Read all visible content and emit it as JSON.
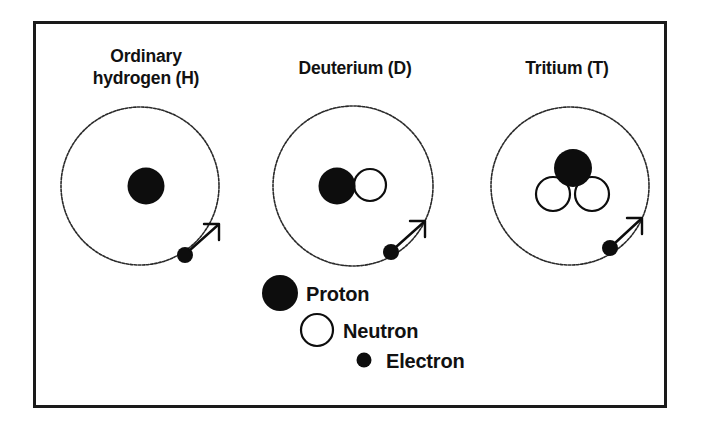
{
  "figure": {
    "frame": {
      "x": 33,
      "y": 21,
      "width": 634,
      "height": 387,
      "border_color": "#1a1a1a"
    }
  },
  "colors": {
    "proton_fill": "#0d0d0d",
    "neutron_fill": "#ffffff",
    "neutron_stroke": "#0d0d0d",
    "electron_fill": "#0d0d0d",
    "orbit_stroke": "#2b2b2b",
    "background": "#ffffff",
    "text": "#111111"
  },
  "atoms": [
    {
      "id": "hydrogen",
      "label_lines": [
        "Ordinary",
        "hydrogen (H)"
      ],
      "label_x": 146,
      "label_y_first": 62,
      "label_line_height": 22,
      "orbit": {
        "cx": 140,
        "cy": 186,
        "r": 79
      },
      "protons": [
        {
          "cx": 146,
          "cy": 186,
          "r": 18.5
        }
      ],
      "neutrons": [],
      "electron": {
        "cx": 185,
        "cy": 255,
        "r": 8
      },
      "arrow": {
        "x1": 190,
        "y1": 250,
        "x2": 218,
        "y2": 225
      }
    },
    {
      "id": "deuterium",
      "label_lines": [
        "Deuterium (D)"
      ],
      "label_x": 355,
      "label_y_first": 74,
      "label_line_height": 22,
      "orbit": {
        "cx": 353,
        "cy": 186,
        "r": 80
      },
      "protons": [
        {
          "cx": 337,
          "cy": 186,
          "r": 18.5
        }
      ],
      "neutrons": [
        {
          "cx": 370,
          "cy": 185,
          "r": 16
        }
      ],
      "electron": {
        "cx": 391,
        "cy": 252,
        "r": 8
      },
      "arrow": {
        "x1": 396,
        "y1": 247,
        "x2": 424,
        "y2": 222
      }
    },
    {
      "id": "tritium",
      "label_lines": [
        "Tritium (T)"
      ],
      "label_x": 567,
      "label_y_first": 74,
      "label_line_height": 22,
      "orbit": {
        "cx": 570,
        "cy": 186,
        "r": 79
      },
      "protons": [
        {
          "cx": 573,
          "cy": 168,
          "r": 19
        }
      ],
      "neutrons": [
        {
          "cx": 553,
          "cy": 194,
          "r": 17
        },
        {
          "cx": 592,
          "cy": 194,
          "r": 17
        }
      ],
      "electron": {
        "cx": 610,
        "cy": 248,
        "r": 8
      },
      "arrow": {
        "x1": 615,
        "y1": 243,
        "x2": 641,
        "y2": 219
      }
    }
  ],
  "legend": {
    "items": [
      {
        "id": "proton",
        "label": "Proton",
        "marker": "filled-circle",
        "marker_cx": 280,
        "marker_cy": 293,
        "marker_r": 18,
        "label_x": 306,
        "label_y": 301
      },
      {
        "id": "neutron",
        "label": "Neutron",
        "marker": "open-circle",
        "marker_cx": 317,
        "marker_cy": 330,
        "marker_r": 16,
        "label_x": 343,
        "label_y": 338
      },
      {
        "id": "electron",
        "label": "Electron",
        "marker": "small-filled-circle",
        "marker_cx": 364,
        "marker_cy": 360,
        "marker_r": 7.5,
        "label_x": 386,
        "label_y": 368
      }
    ]
  }
}
